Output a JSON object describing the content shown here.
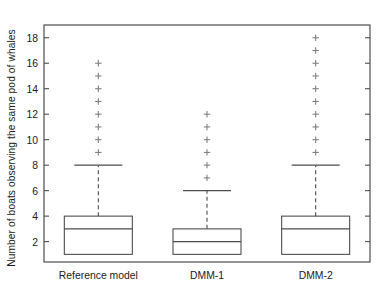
{
  "chart_data": {
    "type": "box",
    "title": "",
    "xlabel": "",
    "ylabel": "Number of boats observing the same pod of whales",
    "categories": [
      "Reference model",
      "DMM-1",
      "DMM-2"
    ],
    "ylim": [
      0.4,
      19.0
    ],
    "yticks": [
      2,
      4,
      6,
      8,
      10,
      12,
      14,
      16,
      18
    ],
    "ytick_labels": [
      "2",
      "4",
      "6",
      "8",
      "10",
      "12",
      "14",
      "16",
      "18"
    ],
    "grid": false,
    "legend": "none",
    "frame": "box",
    "tick_direction": "in",
    "boxes": [
      {
        "category": "Reference model",
        "whisker_low": 1,
        "q1": 1,
        "median": 3,
        "q3": 4,
        "whisker_high": 8,
        "outliers": [
          9,
          10,
          11,
          12,
          13,
          14,
          15,
          16
        ]
      },
      {
        "category": "DMM-1",
        "whisker_low": 1,
        "q1": 1,
        "median": 2,
        "q3": 3,
        "whisker_high": 6,
        "outliers": [
          7,
          8,
          9,
          10,
          11,
          12
        ]
      },
      {
        "category": "DMM-2",
        "whisker_low": 1,
        "q1": 1,
        "median": 3,
        "q3": 4,
        "whisker_high": 8,
        "outliers": [
          9,
          10,
          11,
          12,
          13,
          14,
          15,
          16,
          17,
          18
        ]
      }
    ],
    "colors": {
      "line": "#4d4d4d",
      "axis": "#4d4d4d",
      "outlier": "#808080",
      "text": "#1a1a1a",
      "background": "#ffffff"
    }
  }
}
